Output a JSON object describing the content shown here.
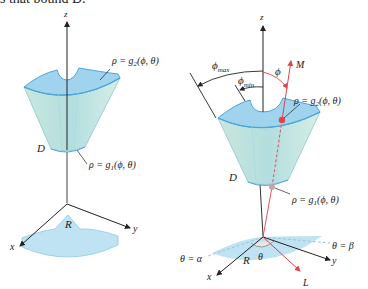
{
  "header": {
    "clipped_text": "s that bound D."
  },
  "left_figure": {
    "axis_z": "z",
    "axis_x": "x",
    "axis_y": "y",
    "region_label": "D",
    "base_label": "R",
    "outer_surface": {
      "lhs": "ρ = g",
      "sub": "2",
      "rhs": "(ϕ, θ)"
    },
    "inner_surface": {
      "lhs": "ρ = g",
      "sub": "1",
      "rhs": "(ϕ, θ)"
    }
  },
  "right_figure": {
    "axis_z": "z",
    "axis_x": "x",
    "axis_y": "y",
    "region_label": "D",
    "base_label": "R",
    "angle_theta": "θ",
    "angle_phi": "ϕ",
    "phi_max": {
      "sym": "ϕ",
      "sub": "max"
    },
    "phi_min": {
      "sym": "ϕ",
      "sub": "min"
    },
    "ray_upper": "M",
    "ray_lower": "L",
    "theta_alpha": "θ = α",
    "theta_beta": "θ = β",
    "outer_surface": {
      "lhs": "ρ = g",
      "sub": "2",
      "rhs": "(ϕ, θ)"
    },
    "inner_surface": {
      "lhs": "ρ = g",
      "sub": "1",
      "rhs": "(ϕ, θ)"
    }
  },
  "colors": {
    "solid_fill": "#b9e0df",
    "solid_top": "#9fd3ee",
    "edge": "#4aa6d8",
    "base_fill": "#bfe3f2",
    "axis": "#222222",
    "ray": "#e0434a"
  }
}
